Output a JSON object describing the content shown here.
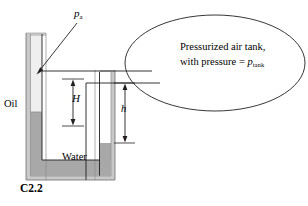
{
  "figure": {
    "id_label": "C2.2",
    "caption_ref": "C2.2",
    "type": "manometer-pressurized-tank-diagram"
  },
  "labels": {
    "atmospheric_pressure": "p",
    "atmospheric_pressure_sub": "a",
    "oil": "Oil",
    "water": "Water",
    "height_H": "H",
    "height_h": "h",
    "tank_text_line1": "Pressurized air tank,",
    "tank_text_line2_prefix": "with pressure = ",
    "tank_text_line2_symbol": "p",
    "tank_text_line2_sub": "tank"
  },
  "colors": {
    "stroke": "#231f20",
    "water_fill": "#a8a8a8",
    "oil_fill": "#e9e9e9",
    "tube_wall": "#c9c9c9",
    "background": "#ffffff",
    "text": "#000000"
  },
  "geometry": {
    "tank_ellipse": {
      "cx": 215,
      "cy": 63,
      "rx": 90,
      "ry": 48
    },
    "left_tube": {
      "x_outer_left": 26,
      "x_outer_right": 46,
      "top": 33,
      "bottom": 180
    },
    "right_tube": {
      "x_outer_left": 95,
      "x_outer_right": 115,
      "top": 70,
      "bottom": 180
    },
    "oil_water_interface_y": 112,
    "upper_pipe_y": 71,
    "lower_pipe_y": 83,
    "h_bottom_y": 143,
    "H_top_y": 79,
    "H_bottom_y": 126
  }
}
